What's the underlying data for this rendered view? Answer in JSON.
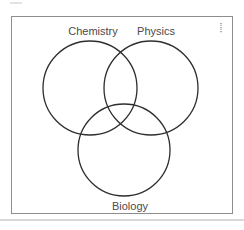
{
  "venn": {
    "sets": [
      {
        "id": "chemistry",
        "label": "Chemistry",
        "position": "top-left"
      },
      {
        "id": "physics",
        "label": "Physics",
        "position": "top-right"
      },
      {
        "id": "biology",
        "label": "Biology",
        "position": "bottom-center"
      }
    ],
    "overlap": "all three circles mutually overlap with a common center region"
  },
  "colors": {
    "circle_stroke": "#2e2e2e",
    "label_text": "#4a4a4a",
    "frame_border": "#8d8d8d",
    "bottom_rule": "#d9d9d9"
  }
}
